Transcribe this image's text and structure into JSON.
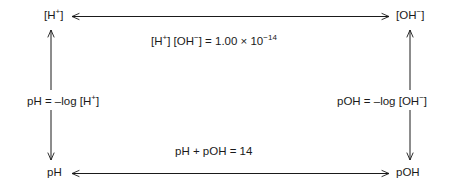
{
  "diagram": {
    "type": "cycle-diagram",
    "background_color": "#ffffff",
    "line_color": "#1a1a1a",
    "text_color": "#1a1a1a",
    "nodes": [
      {
        "id": "h-plus",
        "label": "[H",
        "sup": "+",
        "tail": "]",
        "position": "top-left"
      },
      {
        "id": "oh-minus",
        "label": "[OH",
        "sup": "−",
        "tail": "]",
        "position": "top-right"
      },
      {
        "id": "ph",
        "label": "pH",
        "sup": "",
        "tail": "",
        "position": "bottom-left"
      },
      {
        "id": "poh",
        "label": "pOH",
        "sup": "",
        "tail": "",
        "position": "bottom-right"
      }
    ],
    "edges": [
      {
        "id": "top-edge",
        "from": "h-plus",
        "to": "oh-minus",
        "orientation": "horizontal",
        "arrowheads": "both",
        "label_id": "kw"
      },
      {
        "id": "left-upper-edge",
        "from": "ph-definition",
        "to": "h-plus",
        "orientation": "vertical",
        "arrowheads": "up",
        "label_id": "ph-def"
      },
      {
        "id": "left-lower-edge",
        "from": "ph-definition",
        "to": "ph",
        "orientation": "vertical",
        "arrowheads": "down",
        "label_id": "ph-def"
      },
      {
        "id": "right-upper-edge",
        "from": "poh-definition",
        "to": "oh-minus",
        "orientation": "vertical",
        "arrowheads": "up",
        "label_id": "poh-def"
      },
      {
        "id": "right-lower-edge",
        "from": "poh-definition",
        "to": "poh",
        "orientation": "vertical",
        "arrowheads": "down",
        "label_id": "poh-def"
      },
      {
        "id": "bottom-edge",
        "from": "ph",
        "to": "poh",
        "orientation": "horizontal",
        "arrowheads": "both",
        "label_id": "sum"
      }
    ],
    "labels": {
      "kw": {
        "text": "[H+] [OH−] = 1.00 × 10−14",
        "parts": [
          {
            "text": "[H",
            "style": "normal"
          },
          {
            "text": "+",
            "style": "superscript"
          },
          {
            "text": "] [OH",
            "style": "normal"
          },
          {
            "text": "−",
            "style": "superscript"
          },
          {
            "text": "] = 1.00 × 10",
            "style": "normal"
          },
          {
            "text": "−14",
            "style": "superscript"
          }
        ]
      },
      "ph_def": {
        "text": "pH = –log [H+]",
        "parts": [
          {
            "text": "pH = –log [H",
            "style": "normal"
          },
          {
            "text": "+",
            "style": "superscript"
          },
          {
            "text": "]",
            "style": "normal"
          }
        ]
      },
      "poh_def": {
        "text": "pOH = –log [OH−]",
        "parts": [
          {
            "text": "pOH = –log [OH",
            "style": "normal"
          },
          {
            "text": "−",
            "style": "superscript"
          },
          {
            "text": "]",
            "style": "normal"
          }
        ]
      },
      "sum": {
        "text": "pH + pOH = 14",
        "parts": [
          {
            "text": "pH + pOH = 14",
            "style": "normal"
          }
        ]
      }
    }
  }
}
